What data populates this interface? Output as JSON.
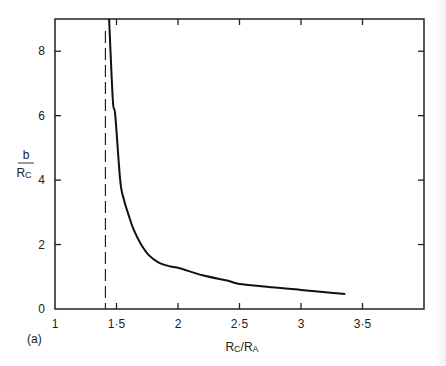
{
  "chart_data": {
    "type": "line",
    "title": "",
    "panel_label": "(a)",
    "xlabel": "R_C/R_A",
    "xlabel_main": "R",
    "xlabel_sub1": "C",
    "xlabel_sep": "/R",
    "xlabel_sub2": "A",
    "ylabel": "b/R_C",
    "ylabel_num": "b",
    "ylabel_den": "R",
    "ylabel_den_sub": "C",
    "xlim": [
      1,
      4
    ],
    "ylim": [
      0,
      9
    ],
    "grid": false,
    "legend": null,
    "x_ticks": [
      1,
      1.5,
      2,
      2.5,
      3,
      3.5
    ],
    "x_tick_labels": [
      "1",
      "1·5",
      "2",
      "2·5",
      "3",
      "3·5"
    ],
    "y_ticks": [
      0,
      2,
      4,
      6,
      8
    ],
    "y_tick_labels": [
      "0",
      "2",
      "4",
      "6",
      "8"
    ],
    "asymptote": {
      "x": 1.41,
      "style": "dashed"
    },
    "series": [
      {
        "name": "b/R_C",
        "x": [
          1.44,
          1.47,
          1.49,
          1.53,
          1.56,
          1.6,
          1.64,
          1.7,
          1.76,
          1.84,
          1.94,
          2.0,
          2.2,
          2.4,
          2.5,
          2.7,
          2.9,
          3.0,
          3.2,
          3.36
        ],
        "y": [
          9.0,
          6.5,
          6.0,
          4.0,
          3.4,
          2.9,
          2.46,
          2.0,
          1.68,
          1.45,
          1.32,
          1.28,
          1.05,
          0.88,
          0.78,
          0.7,
          0.63,
          0.59,
          0.52,
          0.47
        ]
      }
    ]
  }
}
